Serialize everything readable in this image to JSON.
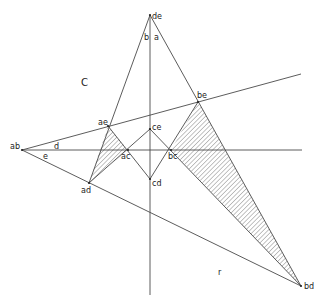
{
  "diagram": {
    "title": "",
    "points": {
      "de": {
        "label": "de",
        "x": 150,
        "y": 15
      },
      "ab": {
        "label": "ab",
        "x": 22,
        "y": 150
      },
      "ae": {
        "label": "ae",
        "x": 108,
        "y": 126
      },
      "be": {
        "label": "be",
        "x": 198,
        "y": 102
      },
      "ac": {
        "label": "ac",
        "x": 128,
        "y": 150
      },
      "bc": {
        "label": "bc",
        "x": 171,
        "y": 150
      },
      "ce": {
        "label": "ce",
        "x": 150,
        "y": 129
      },
      "cd": {
        "label": "cd",
        "x": 150,
        "y": 179
      },
      "ad": {
        "label": "ad",
        "x": 89,
        "y": 183
      },
      "bd": {
        "label": "bd",
        "x": 301,
        "y": 286
      }
    },
    "region_labels": {
      "a": "a",
      "b": "b",
      "C": "C",
      "d": "d",
      "e": "e"
    },
    "lines": [
      {
        "from": "de",
        "to": "ad",
        "desc": "line de-ae-ad"
      },
      {
        "from": "de",
        "to": "bd",
        "desc": "line de-be-bd"
      },
      {
        "from": "ab",
        "to": "end_upper",
        "desc": "line ab-ae-be extended"
      },
      {
        "from": "ab",
        "to": "end_horiz",
        "desc": "horizontal line ab-ac-bc"
      },
      {
        "from": "ab",
        "to": "bd",
        "desc": "line ab-ad-bd"
      },
      {
        "from": "de",
        "to": "end_vert",
        "desc": "vertical axis"
      },
      {
        "from": "ae",
        "to": "cd",
        "desc": "ae-ac-cd"
      },
      {
        "from": "ad",
        "to": "ce",
        "desc": "ad-ac-ce"
      },
      {
        "from": "ce",
        "to": "bd",
        "desc": "ce-bc-bd"
      },
      {
        "from": "cd",
        "to": "be",
        "desc": "cd-bc-be"
      }
    ],
    "hatched_regions": [
      {
        "name": "left-hatched-triangle",
        "vertices": [
          "ae",
          "ac",
          "ad"
        ]
      },
      {
        "name": "right-hatched-triangle",
        "vertices": [
          "be",
          "bc",
          "bd"
        ]
      }
    ],
    "stray_mark": "r"
  }
}
